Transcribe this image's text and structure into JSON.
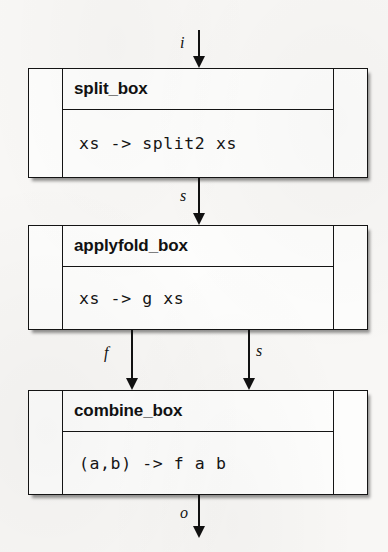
{
  "diagram": {
    "type": "dataflow-block-diagram",
    "background_color": "#f8f7f5",
    "stroke_color": "#111111",
    "nodes": [
      {
        "id": "split_box",
        "title": "split_box",
        "expression": "xs -> split2 xs"
      },
      {
        "id": "applyfold_box",
        "title": "applyfold_box",
        "expression": "xs -> g xs"
      },
      {
        "id": "combine_box",
        "title": "combine_box",
        "expression": "(a,b) -> f a b"
      }
    ],
    "edges": [
      {
        "id": "edge-input-i",
        "label": "i",
        "from": "external-input",
        "to": "split_box"
      },
      {
        "id": "edge-split-to-applyfold",
        "label": "s",
        "from": "split_box",
        "to": "applyfold_box"
      },
      {
        "id": "edge-applyfold-to-combine-f",
        "label": "f",
        "from": "applyfold_box",
        "to": "combine_box"
      },
      {
        "id": "edge-applyfold-to-combine-s",
        "label": "s",
        "from": "applyfold_box",
        "to": "combine_box"
      },
      {
        "id": "edge-output-o",
        "label": "o",
        "from": "combine_box",
        "to": "external-output"
      }
    ]
  }
}
